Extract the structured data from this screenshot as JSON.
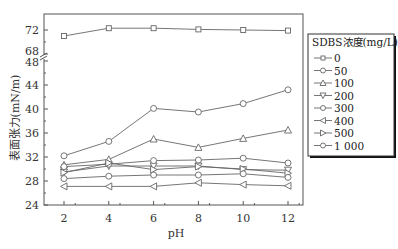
{
  "chart_data": {
    "type": "line",
    "title": "",
    "xlabel": "pH",
    "ylabel": "表面张力(mN/m)",
    "x": [
      2,
      4,
      6,
      8,
      10,
      12
    ],
    "xticks": [
      "2",
      "4",
      "6",
      "8",
      "10",
      "12"
    ],
    "yticks_lower": [
      "24",
      "28",
      "32",
      "36",
      "40",
      "44",
      "48"
    ],
    "yticks_upper": [
      "68",
      "72"
    ],
    "ylim": [
      24,
      73
    ],
    "y_axis_break": [
      48,
      68
    ],
    "grid": false,
    "legend_position": "right",
    "legend_title": "SDBS浓度(mg/L)",
    "series": [
      {
        "name": "0",
        "marker": "square",
        "values": [
          71.0,
          72.3,
          72.3,
          72.1,
          72.0,
          71.9
        ]
      },
      {
        "name": "50",
        "marker": "circle",
        "values": [
          32.2,
          34.6,
          40.1,
          39.5,
          40.9,
          43.2
        ]
      },
      {
        "name": "100",
        "marker": "triangle-up",
        "values": [
          30.7,
          31.6,
          35.0,
          33.6,
          35.1,
          36.5
        ]
      },
      {
        "name": "200",
        "marker": "triangle-down",
        "values": [
          29.5,
          30.5,
          30.5,
          30.5,
          29.9,
          29.8
        ]
      },
      {
        "name": "300",
        "marker": "hexagon",
        "values": [
          30.4,
          30.8,
          31.4,
          31.5,
          31.8,
          31.0
        ]
      },
      {
        "name": "400",
        "marker": "triangle-left",
        "values": [
          27.1,
          27.1,
          27.1,
          27.7,
          27.4,
          27.2
        ]
      },
      {
        "name": "500",
        "marker": "triangle-right",
        "values": [
          29.4,
          31.0,
          29.9,
          30.4,
          30.0,
          29.3
        ]
      },
      {
        "name": "1 000",
        "marker": "circle",
        "values": [
          28.4,
          28.8,
          29.0,
          29.0,
          29.2,
          28.6
        ]
      }
    ]
  },
  "colors": {
    "line": "#666666",
    "axis": "#555555",
    "text": "#333333"
  }
}
